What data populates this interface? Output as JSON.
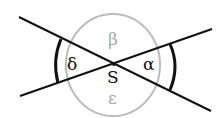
{
  "diagram": {
    "type": "intersecting-lines-angles",
    "vertex_label": "S",
    "angles": {
      "alpha": "α",
      "beta": "β",
      "delta": "δ",
      "epsilon": "ε"
    },
    "colors": {
      "lines": "#111111",
      "circle": "#bbbbbb",
      "gray_labels": "#a8a8a8",
      "dark_labels": "#111111"
    }
  }
}
